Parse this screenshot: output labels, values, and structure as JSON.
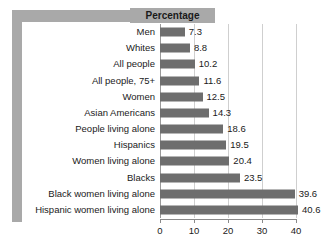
{
  "title": "Percentage",
  "chart_data": {
    "type": "bar",
    "orientation": "horizontal",
    "title": "Percentage",
    "xlabel": "",
    "ylabel": "",
    "xlim": [
      0,
      40
    ],
    "xticks": [
      0,
      10,
      20,
      30,
      40
    ],
    "xtick_labels": [
      "0",
      "10",
      "20",
      "30",
      "40"
    ],
    "grid": true,
    "legend": false,
    "bar_color": "#6e6e6e",
    "gridline_color": "#cfcfcf",
    "frame_color": "#a9a9a9",
    "categories": [
      "Men",
      "Whites",
      "All people",
      "All people, 75+",
      "Women",
      "Asian Americans",
      "People living alone",
      "Hispanics",
      "Women living alone",
      "Blacks",
      "Black women living alone",
      "Hispanic women living alone"
    ],
    "values": [
      7.3,
      8.8,
      10.2,
      11.6,
      12.5,
      14.3,
      18.6,
      19.5,
      20.4,
      23.5,
      39.6,
      40.6
    ],
    "value_labels": [
      "7.3",
      "8.8",
      "10.2",
      "11.6",
      "12.5",
      "14.3",
      "18.6",
      "19.5",
      "20.4",
      "23.5",
      "39.6",
      "40.6"
    ]
  }
}
